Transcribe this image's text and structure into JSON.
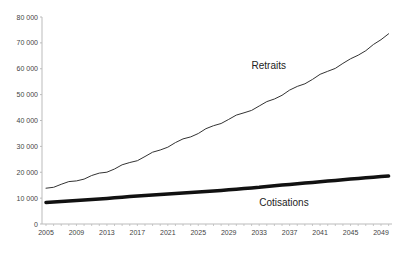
{
  "chart_data": {
    "type": "line",
    "title": "",
    "xlabel": "",
    "ylabel": "",
    "ylim": [
      0,
      80000
    ],
    "xlim": [
      2005,
      2050
    ],
    "grid": false,
    "legend": "inline labels",
    "y_ticks": [
      0,
      10000,
      20000,
      30000,
      40000,
      50000,
      60000,
      70000,
      80000
    ],
    "y_tick_labels": [
      "0",
      "10 000",
      "20 000",
      "30 000",
      "40 000",
      "50 000",
      "60 000",
      "70 000",
      "80 000"
    ],
    "x_tick_labels": [
      "2005",
      "2009",
      "2013",
      "2017",
      "2021",
      "2025",
      "2029",
      "2033",
      "2037",
      "2041",
      "2045",
      "2049"
    ],
    "x": [
      2005,
      2009,
      2013,
      2017,
      2021,
      2025,
      2029,
      2033,
      2037,
      2041,
      2045,
      2049,
      2050
    ],
    "series": [
      {
        "name": "Retraits",
        "color": "#333333",
        "line_width": 1,
        "values": [
          13800,
          16800,
          20300,
          24800,
          30000,
          35200,
          40500,
          45500,
          51500,
          57500,
          63500,
          71000,
          73500
        ]
      },
      {
        "name": "Cotisations",
        "color": "#111111",
        "line_width": 3.5,
        "values": [
          8300,
          9100,
          9900,
          10800,
          11600,
          12400,
          13200,
          14200,
          15300,
          16300,
          17400,
          18300,
          18500
        ]
      }
    ],
    "annotations": [
      {
        "text": "Retraits",
        "x": 2032,
        "y": 60000
      },
      {
        "text": "Cotisations",
        "x": 2033,
        "y": 7000
      }
    ]
  }
}
